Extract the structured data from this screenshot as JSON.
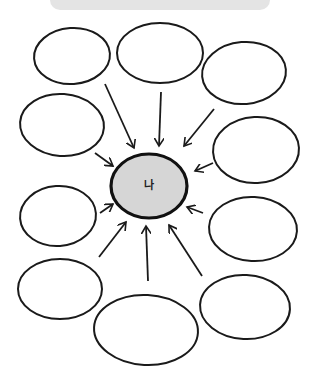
{
  "banner": {
    "text": ""
  },
  "diagram": {
    "center": {
      "label": "나",
      "fill": "#d6d6d6",
      "stroke": "#111111"
    },
    "bubble_count": 9,
    "arrow_count": 10,
    "stroke_color": "#1a1a1a"
  }
}
